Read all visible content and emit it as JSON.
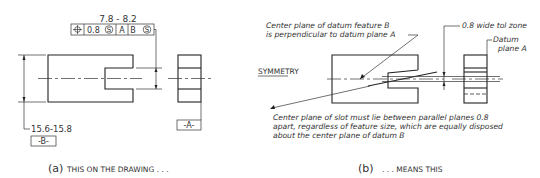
{
  "panel_a": {
    "caption_letter": "(a)",
    "caption_text": "THIS ON THE DRAWING . . .",
    "slot_width_dim": "7.8 - 8.2",
    "fcf": {
      "symbol": "⌖",
      "tolerance": "0.8",
      "modifier1": "S",
      "datum1": "A",
      "datum2": "B",
      "modifier2": "S"
    },
    "overall_dim": "15.6-15.8",
    "datum_b_label": "-B-",
    "datum_a_label": "-A-"
  },
  "panel_b": {
    "caption_letter": "(b)",
    "caption_text": ". . . MEANS THIS",
    "symmetry_label": "SYMMETRY",
    "note_datum_b_line1": "Center plane of datum feature B",
    "note_datum_b_line2": "is perpendicular to datum plane A",
    "note_tol_zone": "0.8 wide tol zone",
    "note_datum_a_line1": "Datum",
    "note_datum_a_line2": "plane A",
    "note_slot_line1": "Center plane of slot must lie between parallel planes 0.8",
    "note_slot_line2": "apart, regardless of feature size, which are equally disposed",
    "note_slot_line3": "about the center plane of datum B"
  }
}
